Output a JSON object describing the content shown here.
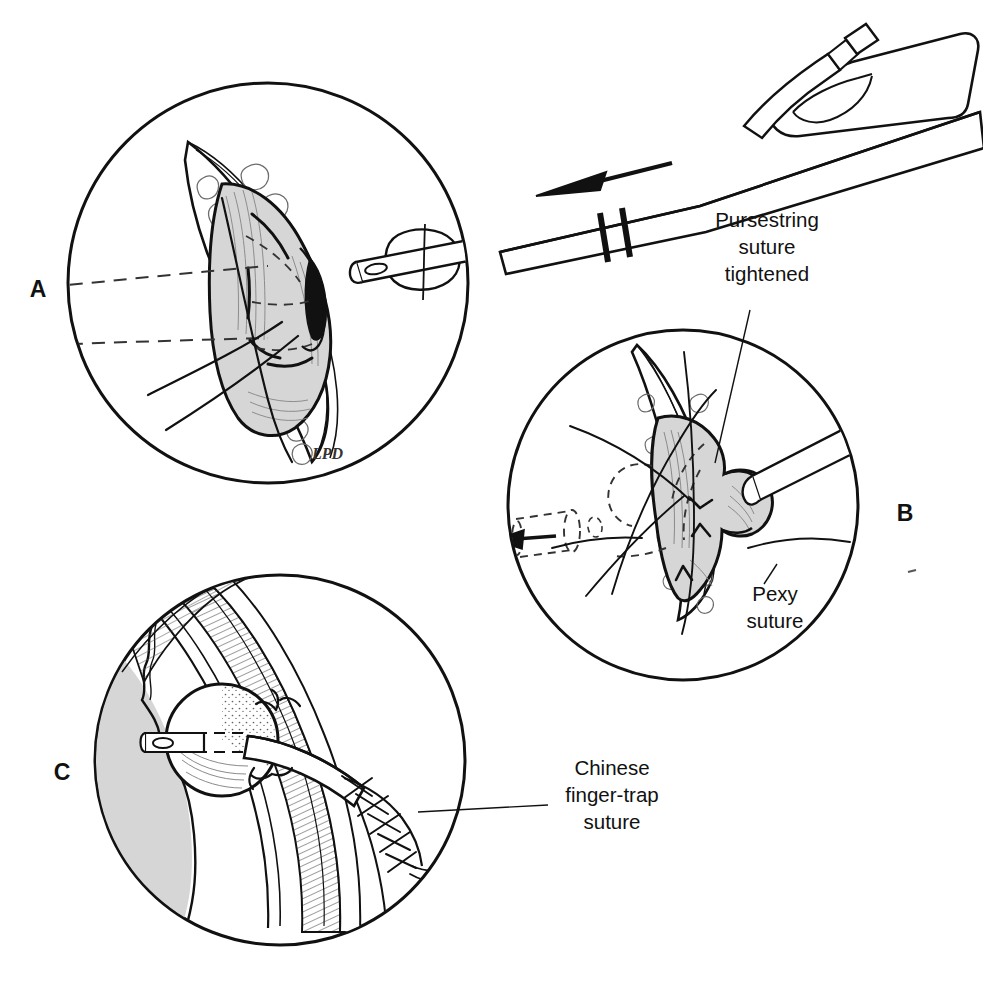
{
  "figure": {
    "kind": "medical-surgical-illustration",
    "signature": "LPD",
    "background_color": "#ffffff",
    "ink_color": "#111111",
    "tissue_fill_color": "#d6d6d6",
    "hatch_color": "#555555"
  },
  "panels": [
    {
      "id": "A",
      "letter": "A",
      "letter_x": 38,
      "letter_y": 297,
      "circle": {
        "cx": 268,
        "cy": 283,
        "r": 200
      },
      "description": "Gastric wall exposed through incision; balloon catheter tip approaching stoma site; pursestring suture placed loosely"
    },
    {
      "id": "B",
      "letter": "B",
      "letter_x": 905,
      "letter_y": 521,
      "circle": {
        "cx": 683,
        "cy": 505,
        "r": 175
      },
      "description": "Catheter inserted into stomach, pursestring suture tightened around tube, pexy sutures anchoring stomach to abdominal wall"
    },
    {
      "id": "C",
      "letter": "C",
      "letter_x": 62,
      "letter_y": 780,
      "circle": {
        "cx": 280,
        "cy": 760,
        "r": 185
      },
      "description": "Cross-section of abdominal wall with inflated balloon inside stomach lumen and Chinese finger-trap suture securing the external tube"
    }
  ],
  "callouts": [
    {
      "id": "pursestring",
      "lines": [
        "Pursestring",
        "suture",
        "tightened"
      ],
      "text_x": 767,
      "text_y": 227,
      "line_height": 27,
      "leader": {
        "x1": 750,
        "y1": 310,
        "x2": 715,
        "y2": 463
      }
    },
    {
      "id": "pexy",
      "lines": [
        "Pexy",
        "suture"
      ],
      "text_x": 771,
      "text_y": 601,
      "line_height": 27,
      "leader": {
        "x1": 775,
        "y1": 566,
        "x2": 762,
        "y2": 582
      }
    },
    {
      "id": "chinese-finger-trap",
      "lines": [
        "Chinese",
        "finger-trap",
        "suture"
      ],
      "text_x": 555,
      "text_y": 775,
      "line_height": 27,
      "leader": {
        "x1": 548,
        "y1": 802,
        "x2": 415,
        "y2": 812
      }
    }
  ],
  "annotations": {
    "traction_arrow_label": "traction direction",
    "break_symbol_label": "tube-length break",
    "retraction_arrow_label": "tube withdrawal direction"
  }
}
